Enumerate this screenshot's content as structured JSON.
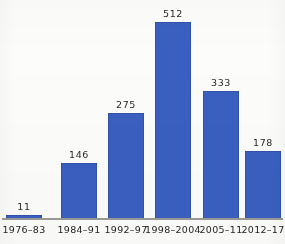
{
  "chart_data": {
    "type": "bar",
    "title": "",
    "subtitle": "",
    "xlabel": "",
    "ylabel": "",
    "categories": [
      "1976–83",
      "1984–91",
      "1992–97",
      "1998–2004",
      "2005–11",
      "2012–17"
    ],
    "values": [
      11,
      146,
      275,
      512,
      333,
      178
    ],
    "value_labels": [
      "11",
      "146",
      "275",
      "512",
      "333",
      "178"
    ],
    "ylim": [
      0,
      512
    ],
    "grid": false,
    "legend": null,
    "legend_position": "none",
    "series": [
      {
        "name": "",
        "values": [
          11,
          146,
          275,
          512,
          333,
          178
        ]
      }
    ],
    "bar_color": "#3a5fc0",
    "axis_color": "#9a9a97",
    "background_color": "#fcfcfa",
    "label_color": "#1f1f1f"
  }
}
